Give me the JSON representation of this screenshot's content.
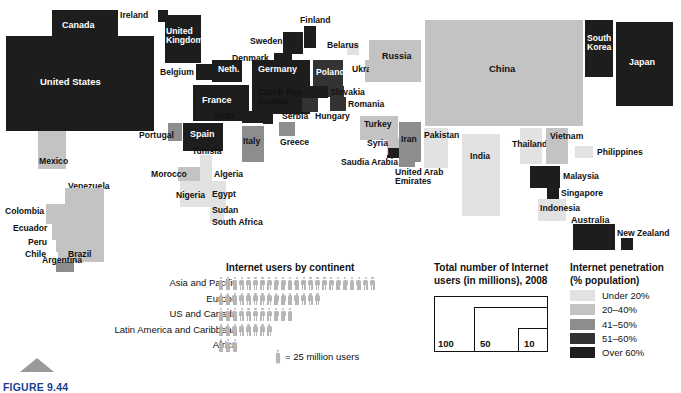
{
  "figure": {
    "number": "FIGURE 9.44",
    "triangle_icon": "triangle-marker"
  },
  "chart_data": {
    "type": "cartogram",
    "value_encoding": "block area = total number of Internet users (millions)",
    "color_encoding": "Internet penetration (% population)",
    "countries": [
      {
        "name": "Canada",
        "band": 5,
        "x": 52,
        "y": 10,
        "w": 66,
        "h": 32,
        "label_pos": "inside",
        "label_x": 62,
        "label_y": 21
      },
      {
        "name": "United States",
        "band": 5,
        "x": 6,
        "y": 36,
        "w": 148,
        "h": 95,
        "label_pos": "inside",
        "label_x": 40,
        "label_y": 77
      },
      {
        "name": "Mexico",
        "band": 2,
        "x": 38,
        "y": 131,
        "w": 28,
        "h": 38,
        "label_pos": "inside-dark",
        "label_x": 39,
        "label_y": 157
      },
      {
        "name": "Venezuela",
        "band": 2,
        "x": 65,
        "y": 188,
        "w": 22,
        "h": 16,
        "label_pos": "outside",
        "label_x": 68,
        "label_y": 182
      },
      {
        "name": "Colombia",
        "band": 2,
        "x": 46,
        "y": 204,
        "w": 20,
        "h": 20,
        "label_pos": "inside-dark",
        "label_x": 5,
        "label_y": 207
      },
      {
        "name": "Ecuador",
        "band": 2,
        "x": 52,
        "y": 224,
        "w": 14,
        "h": 16,
        "label_pos": "outside",
        "label_x": 13,
        "label_y": 224
      },
      {
        "name": "Peru",
        "band": 2,
        "x": 56,
        "y": 240,
        "w": 10,
        "h": 12,
        "label_pos": "outside",
        "label_x": 28,
        "label_y": 238
      },
      {
        "name": "Chile",
        "band": 2,
        "x": 58,
        "y": 252,
        "w": 8,
        "h": 10,
        "label_pos": "outside",
        "label_x": 25,
        "label_y": 250
      },
      {
        "name": "Brazil",
        "band": 2,
        "x": 66,
        "y": 188,
        "w": 38,
        "h": 74,
        "label_pos": "inside-dark",
        "label_x": 68,
        "label_y": 250
      },
      {
        "name": "Argentina",
        "band": 3,
        "x": 56,
        "y": 262,
        "w": 18,
        "h": 10,
        "label_pos": "outside",
        "label_x": 42,
        "label_y": 256
      },
      {
        "name": "Ireland",
        "band": 5,
        "x": 158,
        "y": 10,
        "w": 10,
        "h": 12,
        "label_pos": "outside",
        "label_x": 120,
        "label_y": 11
      },
      {
        "name": "United Kingdom",
        "band": 5,
        "x": 165,
        "y": 15,
        "w": 36,
        "h": 48,
        "label_pos": "inside",
        "label_x": 166,
        "label_y": 27
      },
      {
        "name": "Belgium",
        "band": 5,
        "x": 196,
        "y": 64,
        "w": 16,
        "h": 16,
        "label_pos": "outside",
        "label_x": 160,
        "label_y": 68
      },
      {
        "name": "Neth.",
        "band": 5,
        "x": 212,
        "y": 60,
        "w": 30,
        "h": 22,
        "label_pos": "inside",
        "label_x": 218,
        "label_y": 65
      },
      {
        "name": "France",
        "band": 5,
        "x": 193,
        "y": 85,
        "w": 56,
        "h": 36,
        "label_pos": "inside",
        "label_x": 202,
        "label_y": 96
      },
      {
        "name": "Switz.",
        "band": 5,
        "x": 242,
        "y": 111,
        "w": 22,
        "h": 12,
        "label_pos": "outside",
        "label_x": 213,
        "label_y": 112
      },
      {
        "name": "Portugal",
        "band": 3,
        "x": 168,
        "y": 123,
        "w": 14,
        "h": 18,
        "label_pos": "outside",
        "label_x": 139,
        "label_y": 131
      },
      {
        "name": "Spain",
        "band": 5,
        "x": 183,
        "y": 123,
        "w": 40,
        "h": 28,
        "label_pos": "inside",
        "label_x": 190,
        "label_y": 130
      },
      {
        "name": "Denmark",
        "band": 5,
        "x": 274,
        "y": 53,
        "w": 18,
        "h": 11,
        "label_pos": "outside",
        "label_x": 232,
        "label_y": 54
      },
      {
        "name": "Germany",
        "band": 5,
        "x": 252,
        "y": 60,
        "w": 58,
        "h": 54,
        "label_pos": "inside",
        "label_x": 258,
        "label_y": 65
      },
      {
        "name": "Sweden",
        "band": 5,
        "x": 283,
        "y": 32,
        "w": 20,
        "h": 22,
        "label_pos": "outside",
        "label_x": 250,
        "label_y": 37
      },
      {
        "name": "Finland",
        "band": 5,
        "x": 304,
        "y": 26,
        "w": 12,
        "h": 22,
        "label_pos": "outside",
        "label_x": 300,
        "label_y": 16
      },
      {
        "name": "Czech Rep.",
        "band": 5,
        "x": 310,
        "y": 86,
        "w": 18,
        "h": 12,
        "label_pos": "outside",
        "label_x": 258,
        "label_y": 88
      },
      {
        "name": "Austria",
        "band": 5,
        "x": 263,
        "y": 112,
        "w": 10,
        "h": 12,
        "label_pos": "outside",
        "label_x": 258,
        "label_y": 97
      },
      {
        "name": "Italy",
        "band": 3,
        "x": 242,
        "y": 126,
        "w": 22,
        "h": 36,
        "label_pos": "inside-dark",
        "label_x": 243,
        "label_y": 137
      },
      {
        "name": "Serbia",
        "band": 3,
        "x": 279,
        "y": 122,
        "w": 16,
        "h": 14,
        "label_pos": "outside",
        "label_x": 282,
        "label_y": 112
      },
      {
        "name": "Greece",
        "band": 3,
        "x": 279,
        "y": 122,
        "w": 16,
        "h": 14,
        "label_pos": "outside",
        "label_x": 280,
        "label_y": 138
      },
      {
        "name": "Poland",
        "band": 4,
        "x": 313,
        "y": 60,
        "w": 30,
        "h": 26,
        "label_pos": "inside",
        "label_x": 316,
        "label_y": 68
      },
      {
        "name": "Slovakia",
        "band": 4,
        "x": 328,
        "y": 86,
        "w": 16,
        "h": 11,
        "label_pos": "outside",
        "label_x": 330,
        "label_y": 88
      },
      {
        "name": "Hungary",
        "band": 4,
        "x": 302,
        "y": 98,
        "w": 16,
        "h": 14,
        "label_pos": "outside",
        "label_x": 315,
        "label_y": 112
      },
      {
        "name": "Romania",
        "band": 4,
        "x": 330,
        "y": 97,
        "w": 16,
        "h": 14,
        "label_pos": "outside",
        "label_x": 348,
        "label_y": 100
      },
      {
        "name": "Belarus",
        "band": 1,
        "x": 347,
        "y": 43,
        "w": 12,
        "h": 12,
        "label_pos": "outside",
        "label_x": 327,
        "label_y": 41
      },
      {
        "name": "Ukraine",
        "band": 2,
        "x": 365,
        "y": 60,
        "w": 22,
        "h": 22,
        "label_pos": "outside",
        "label_x": 352,
        "label_y": 65
      },
      {
        "name": "Russia",
        "band": 2,
        "x": 369,
        "y": 40,
        "w": 52,
        "h": 42,
        "label_pos": "inside-dark",
        "label_x": 382,
        "label_y": 52
      },
      {
        "name": "Turkey",
        "band": 2,
        "x": 360,
        "y": 116,
        "w": 38,
        "h": 24,
        "label_pos": "inside-dark",
        "label_x": 364,
        "label_y": 120
      },
      {
        "name": "Syria",
        "band": 2,
        "x": 387,
        "y": 138,
        "w": 12,
        "h": 10,
        "label_pos": "outside",
        "label_x": 367,
        "label_y": 139
      },
      {
        "name": "Israel",
        "band": 5,
        "x": 387,
        "y": 148,
        "w": 12,
        "h": 10,
        "label_pos": "inside",
        "label_x": 366,
        "label_y": 148
      },
      {
        "name": "Iran",
        "band": 3,
        "x": 399,
        "y": 122,
        "w": 22,
        "h": 40,
        "label_pos": "inside-dark",
        "label_x": 401,
        "label_y": 135
      },
      {
        "name": "Saudia Arabia",
        "band": 3,
        "x": 399,
        "y": 157,
        "w": 16,
        "h": 10,
        "label_pos": "outside",
        "label_x": 341,
        "label_y": 158
      },
      {
        "name": "United Arab Emirates",
        "band": 3,
        "x": 399,
        "y": 157,
        "w": 16,
        "h": 10,
        "label_pos": "outside",
        "label_x": 395,
        "label_y": 168
      },
      {
        "name": "Tunisia",
        "band": 1,
        "x": 200,
        "y": 155,
        "w": 12,
        "h": 12,
        "label_pos": "outside",
        "label_x": 192,
        "label_y": 147
      },
      {
        "name": "Morocco",
        "band": 2,
        "x": 178,
        "y": 167,
        "w": 22,
        "h": 14,
        "label_pos": "outside",
        "label_x": 151,
        "label_y": 170
      },
      {
        "name": "Algeria",
        "band": 1,
        "x": 200,
        "y": 167,
        "w": 12,
        "h": 14,
        "label_pos": "outside",
        "label_x": 214,
        "label_y": 170
      },
      {
        "name": "Nigeria",
        "band": 1,
        "x": 180,
        "y": 181,
        "w": 30,
        "h": 26,
        "label_pos": "outside",
        "label_x": 176,
        "label_y": 191
      },
      {
        "name": "Egypt",
        "band": 1,
        "x": 210,
        "y": 181,
        "w": 16,
        "h": 26,
        "label_pos": "outside",
        "label_x": 212,
        "label_y": 190
      },
      {
        "name": "Sudan",
        "band": 1,
        "x": 210,
        "y": 207,
        "w": 14,
        "h": 10,
        "label_pos": "outside",
        "label_x": 212,
        "label_y": 206
      },
      {
        "name": "South Africa",
        "band": 1,
        "x": 210,
        "y": 213,
        "w": 14,
        "h": 10,
        "label_pos": "outside",
        "label_x": 212,
        "label_y": 218
      },
      {
        "name": "China",
        "band": 2,
        "x": 425,
        "y": 20,
        "w": 158,
        "h": 106,
        "label_pos": "inside-dark",
        "label_x": 489,
        "label_y": 64
      },
      {
        "name": "South Korea",
        "band": 5,
        "x": 585,
        "y": 20,
        "w": 28,
        "h": 57,
        "label_pos": "inside",
        "label_x": 587,
        "label_y": 34
      },
      {
        "name": "Japan",
        "band": 5,
        "x": 616,
        "y": 22,
        "w": 57,
        "h": 84,
        "label_pos": "inside",
        "label_x": 629,
        "label_y": 58
      },
      {
        "name": "Pakistan",
        "band": 1,
        "x": 424,
        "y": 128,
        "w": 24,
        "h": 40,
        "label_pos": "outside",
        "label_x": 424,
        "label_y": 131
      },
      {
        "name": "India",
        "band": 1,
        "x": 462,
        "y": 134,
        "w": 38,
        "h": 82,
        "label_pos": "inside-dark",
        "label_x": 470,
        "label_y": 152
      },
      {
        "name": "Thailand",
        "band": 1,
        "x": 520,
        "y": 128,
        "w": 22,
        "h": 36,
        "label_pos": "outside",
        "label_x": 512,
        "label_y": 140
      },
      {
        "name": "Vietnam",
        "band": 2,
        "x": 546,
        "y": 128,
        "w": 22,
        "h": 36,
        "label_pos": "outside",
        "label_x": 550,
        "label_y": 132
      },
      {
        "name": "Philippines",
        "band": 1,
        "x": 575,
        "y": 146,
        "w": 18,
        "h": 12,
        "label_pos": "outside",
        "label_x": 597,
        "label_y": 148
      },
      {
        "name": "Malaysia",
        "band": 5,
        "x": 530,
        "y": 166,
        "w": 30,
        "h": 22,
        "label_pos": "outside",
        "label_x": 563,
        "label_y": 172
      },
      {
        "name": "Singapore",
        "band": 5,
        "x": 547,
        "y": 188,
        "w": 12,
        "h": 11,
        "label_pos": "outside",
        "label_x": 561,
        "label_y": 189
      },
      {
        "name": "Indonesia",
        "band": 1,
        "x": 538,
        "y": 199,
        "w": 28,
        "h": 22,
        "label_pos": "outside",
        "label_x": 540,
        "label_y": 204
      },
      {
        "name": "Australia",
        "band": 5,
        "x": 573,
        "y": 224,
        "w": 42,
        "h": 26,
        "label_pos": "outside",
        "label_x": 571,
        "label_y": 216
      },
      {
        "name": "New Zealand",
        "band": 5,
        "x": 621,
        "y": 238,
        "w": 12,
        "h": 12,
        "label_pos": "outside",
        "label_x": 617,
        "label_y": 229
      }
    ]
  },
  "pictogram": {
    "title": "Internet users by continent",
    "key_text": "= 25 million users",
    "unit_value": 25,
    "unit_label": "million users",
    "rows": [
      {
        "label": "Asia and Pacific",
        "figures": 23
      },
      {
        "label": "Europe",
        "figures": 15
      },
      {
        "label": "US and Canada",
        "figures": 11
      },
      {
        "label": "Latin America and Caribbean",
        "figures": 8
      },
      {
        "label": "Africa",
        "figures": 3
      }
    ]
  },
  "size_legend": {
    "title_line1": "Total number of Internet",
    "title_line2": "users (in millions), 2008",
    "boxes": [
      {
        "label": "100"
      },
      {
        "label": "50"
      },
      {
        "label": "10"
      }
    ]
  },
  "color_legend": {
    "title_line1": "Internet penetration",
    "title_line2": "(% population)",
    "items": [
      {
        "label": "Under 20%",
        "color": "#e2e2e2",
        "band": 1
      },
      {
        "label": "20–40%",
        "color": "#c3c3c3",
        "band": 2
      },
      {
        "label": "41–50%",
        "color": "#8d8d8d",
        "band": 3
      },
      {
        "label": "51–60%",
        "color": "#333333",
        "band": 4
      },
      {
        "label": "Over 60%",
        "color": "#1d1d1d",
        "band": 5
      }
    ]
  }
}
